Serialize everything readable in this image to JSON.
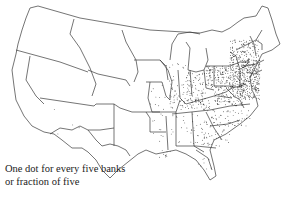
{
  "map": {
    "title": "Distribution of banks in the United States",
    "legend": {
      "caption_line1": "One dot for every five banks",
      "caption_line2": "or fraction of five"
    },
    "colors": {
      "outline": "#3a3a3a",
      "dots": "#222222",
      "background": "#ffffff"
    }
  }
}
